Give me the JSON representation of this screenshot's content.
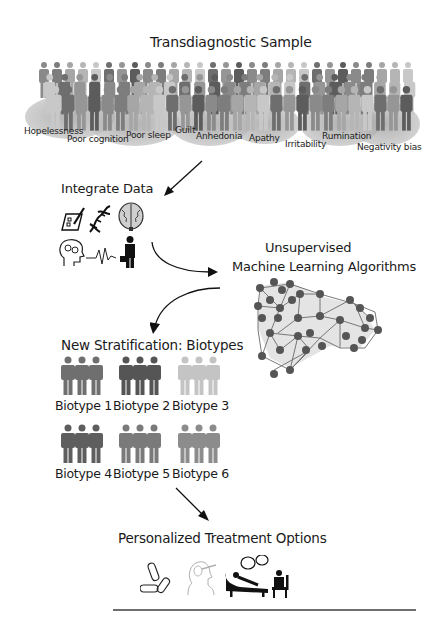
{
  "sample": {
    "title": "Transdiagnostic Sample",
    "symptoms": [
      {
        "label": "Hopelessness",
        "x": 24,
        "y": 126
      },
      {
        "label": "Poor cognition",
        "x": 67,
        "y": 134
      },
      {
        "label": "Poor sleep",
        "x": 126,
        "y": 130
      },
      {
        "label": "Guilt",
        "x": 175,
        "y": 125
      },
      {
        "label": "Anhedonia",
        "x": 196,
        "y": 131
      },
      {
        "label": "Apathy",
        "x": 249,
        "y": 133
      },
      {
        "label": "Irritability",
        "x": 285,
        "y": 139
      },
      {
        "label": "Rumination",
        "x": 322,
        "y": 131
      },
      {
        "label": "Negativity bias",
        "x": 357,
        "y": 142
      }
    ]
  },
  "integrate": {
    "title": "Integrate Data",
    "icons": [
      "clipboard-pen-icon",
      "dna-icon",
      "brain-icon",
      "head-gears-icon",
      "heartbeat-icon",
      "person-briefcase-icon"
    ]
  },
  "ml": {
    "title_line1": "Unsupervised",
    "title_line2": "Machine Learning Algorithms"
  },
  "stratification": {
    "title": "New Stratification: Biotypes",
    "biotypes": [
      {
        "label": "Biotype 1",
        "color": "#6f6f6f"
      },
      {
        "label": "Biotype 2",
        "color": "#555555"
      },
      {
        "label": "Biotype 3",
        "color": "#c4c4c4"
      },
      {
        "label": "Biotype 4",
        "color": "#5e5e5e"
      },
      {
        "label": "Biotype 5",
        "color": "#7a7a7a"
      },
      {
        "label": "Biotype 6",
        "color": "#8c8c8c"
      }
    ]
  },
  "treatment": {
    "title": "Personalized Treatment Options",
    "icons": [
      "pills-icon",
      "brain-stimulation-icon",
      "psychotherapy-icon"
    ]
  }
}
